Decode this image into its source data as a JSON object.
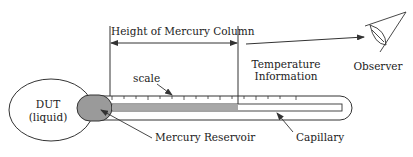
{
  "diagram": {
    "type": "liquid-in-glass thermometer schematic",
    "labels": {
      "height_of_mercury_column": "Height of Mercury Column",
      "scale": "scale",
      "temperature_information_line1": "Temperature",
      "temperature_information_line2": "Information",
      "observer": "Observer",
      "dut_line1": "DUT",
      "dut_line2": "(liquid)",
      "mercury_reservoir": "Mercury Reservoir",
      "capillary": "Capillary"
    },
    "colors": {
      "stroke": "#333333",
      "mercury": "#9a9a9a",
      "mercury_column": "#a8a8a8",
      "background": "#ffffff"
    },
    "scale_ticks": 12
  }
}
